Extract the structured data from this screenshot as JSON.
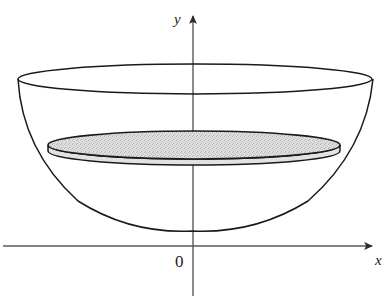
{
  "figure": {
    "type": "math-diagram",
    "canvas": {
      "width": 388,
      "height": 296,
      "background": "#ffffff"
    },
    "labels": {
      "y_axis": "y",
      "x_axis": "x",
      "origin": "0"
    },
    "colors": {
      "stroke": "#1a1a1a",
      "axis": "#5a5a5a",
      "disk_fill": "#d2d2d2",
      "disk_band_fill": "#e6e6e6",
      "background": "#ffffff"
    },
    "axes": {
      "x_axis": {
        "x1": 3,
        "y1": 246,
        "x2": 378,
        "y2": 246,
        "arrow": "right"
      },
      "y_axis": {
        "x1": 193,
        "y1": 296,
        "x2": 193,
        "y2": 10,
        "arrow": "up"
      }
    },
    "shapes": {
      "rim_ellipse": {
        "cx": 195,
        "cy": 79,
        "rx": 177,
        "ry": 15
      },
      "disk_ellipse": {
        "cx": 194,
        "cy": 145,
        "rx": 146,
        "ry": 14
      },
      "disk_band_depth": 12,
      "parabola": {
        "left_point": [
          18,
          79
        ],
        "vertex": [
          192,
          231
        ],
        "right_point": [
          373,
          79
        ]
      }
    }
  }
}
